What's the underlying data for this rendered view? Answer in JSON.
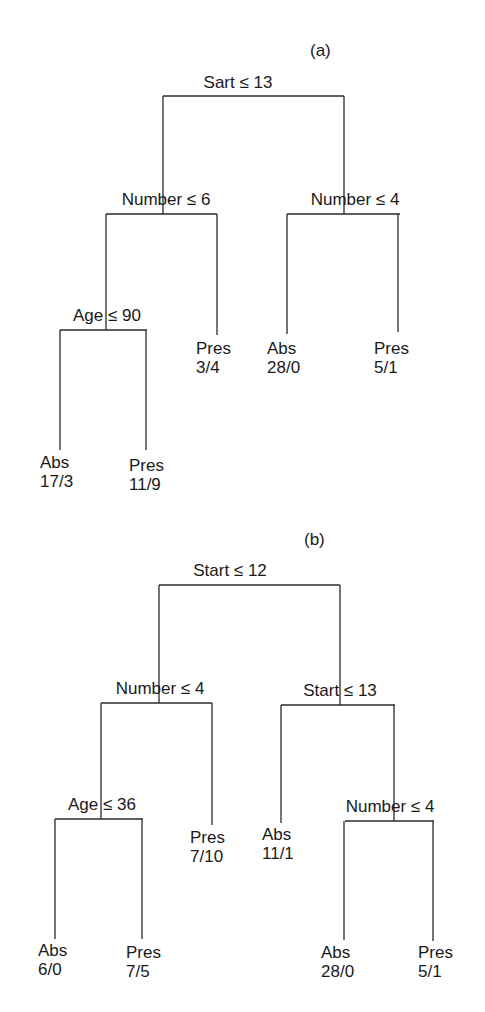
{
  "figure": {
    "panels": [
      {
        "label": "(a)",
        "root": {
          "split": "Sart ≤ 13",
          "left": {
            "split": "Number ≤ 6",
            "left": {
              "split": "Age ≤ 90",
              "left": {
                "class": "Abs",
                "counts": "17/3"
              },
              "right": {
                "class": "Pres",
                "counts": "11/9"
              }
            },
            "right": {
              "class": "Pres",
              "counts": "3/4"
            }
          },
          "right": {
            "split": "Number ≤ 4",
            "left": {
              "class": "Abs",
              "counts": "28/0"
            },
            "right": {
              "class": "Pres",
              "counts": "5/1"
            }
          }
        }
      },
      {
        "label": "(b)",
        "root": {
          "split": "Start ≤ 12",
          "left": {
            "split": "Number ≤ 4",
            "left": {
              "split": "Age ≤ 36",
              "left": {
                "class": "Abs",
                "counts": "6/0"
              },
              "right": {
                "class": "Pres",
                "counts": "7/5"
              }
            },
            "right": {
              "class": "Pres",
              "counts": "7/10"
            }
          },
          "right": {
            "split": "Start ≤ 13",
            "left": {
              "class": "Abs",
              "counts": "11/1"
            },
            "right": {
              "split": "Number ≤ 4",
              "left": {
                "class": "Abs",
                "counts": "28/0"
              },
              "right": {
                "class": "Pres",
                "counts": "5/1"
              }
            }
          }
        }
      }
    ]
  },
  "style": {
    "line_color": "#2a2a2a",
    "text_color": "#1a1a1a",
    "background": "#ffffff"
  }
}
